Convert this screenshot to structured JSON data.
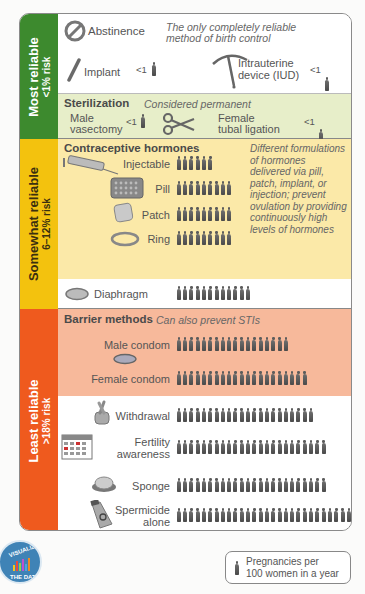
{
  "bands": {
    "most": {
      "title": "Most reliable",
      "sub": "<1% risk",
      "color": "#3d8a2e"
    },
    "somewhat": {
      "title": "Somewhat reliable",
      "sub": "6–12% risk",
      "color": "#f3c20e"
    },
    "least": {
      "title": "Least reliable",
      "sub": ">18% risk",
      "color": "#ef5a1e"
    }
  },
  "abstinence": {
    "label": "Abstinence",
    "note": "The only completely reliable method of birth control"
  },
  "implant": {
    "label": "Implant",
    "value": "<1"
  },
  "iud": {
    "label1": "Intrauterine",
    "label2": "device (IUD)",
    "value": "<1"
  },
  "sterilization": {
    "heading": "Sterilization",
    "note": "Considered permanent",
    "male": {
      "label1": "Male",
      "label2": "vasectomy",
      "value": "<1"
    },
    "female": {
      "label1": "Female",
      "label2": "tubal ligation",
      "value": "<1"
    }
  },
  "hormones": {
    "heading": "Contraceptive hormones",
    "note_lines": [
      "Different formulations",
      "of hormones",
      "delivered via pill,",
      "patch, implant, or",
      "injection; prevent",
      "ovulation by providing",
      "continuously high",
      "levels of hormones"
    ]
  },
  "barrier": {
    "heading": "Barrier methods",
    "note": "Can also prevent STIs"
  },
  "legend": {
    "line1": "Pregnancies per",
    "line2": "100 women in a year"
  },
  "badge": {
    "top": "VISUALIZING",
    "bottom": "THE DATA"
  },
  "chart_data": {
    "type": "bar",
    "unit": "Pregnancies per 100 women in a year",
    "categories": [
      "Abstinence",
      "Implant",
      "Intrauterine device (IUD)",
      "Male vasectomy",
      "Female tubal ligation",
      "Injectable",
      "Pill",
      "Patch",
      "Ring",
      "Diaphragm",
      "Male condom",
      "Female condom",
      "Withdrawal",
      "Fertility awareness",
      "Sponge",
      "Spermicide alone"
    ],
    "values": [
      0,
      "<1",
      "<1",
      "<1",
      "<1",
      6,
      9,
      9,
      9,
      12,
      18,
      21,
      22,
      24,
      24,
      28
    ],
    "groups": [
      {
        "name": "Most reliable (<1% risk)",
        "members": [
          "Abstinence",
          "Implant",
          "Intrauterine device (IUD)",
          "Male vasectomy",
          "Female tubal ligation"
        ]
      },
      {
        "name": "Somewhat reliable (6–12% risk)",
        "members": [
          "Injectable",
          "Pill",
          "Patch",
          "Ring",
          "Diaphragm"
        ]
      },
      {
        "name": "Least reliable (>18% risk)",
        "members": [
          "Male condom",
          "Female condom",
          "Withdrawal",
          "Fertility awareness",
          "Sponge",
          "Spermicide alone"
        ]
      }
    ]
  },
  "rows": {
    "injectable": {
      "label": "Injectable",
      "count": 6
    },
    "pill": {
      "label": "Pill",
      "count": 9
    },
    "patch": {
      "label": "Patch",
      "count": 9
    },
    "ring": {
      "label": "Ring",
      "count": 9
    },
    "diaphragm": {
      "label": "Diaphragm",
      "count": 12
    },
    "male_condom": {
      "label": "Male condom",
      "count": 18
    },
    "female_condom": {
      "label": "Female condom",
      "count": 21
    },
    "withdrawal": {
      "label": "Withdrawal",
      "count": 22
    },
    "fertility": {
      "label1": "Fertility",
      "label2": "awareness",
      "count": 24
    },
    "sponge": {
      "label": "Sponge",
      "count": 24
    },
    "spermicide": {
      "label1": "Spermicide",
      "label2": "alone",
      "count": 28
    }
  }
}
